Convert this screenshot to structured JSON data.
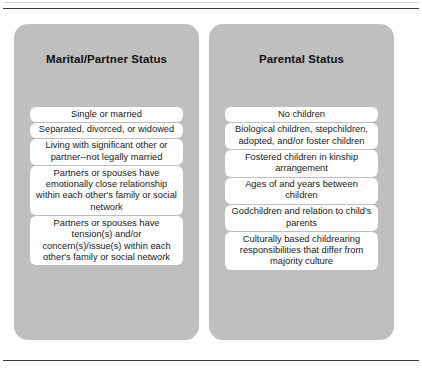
{
  "document": {
    "type": "two-column-reference-table",
    "top_rule": true,
    "bottom_rule": true,
    "panel_color": "#bfbfbf",
    "item_color": "#ffffff",
    "text_color": "#1a1a1a"
  },
  "columns": [
    {
      "title": "Marital/Partner Status",
      "items": [
        "Single or married",
        "Separated, divorced, or widowed",
        "Living with significant other or partner--not legally married",
        "Partners or spouses have emotionally close relationship within each other's family or social network",
        "Partners or spouses have tension(s) and/or concern(s)/issue(s) within each other's family or social network"
      ]
    },
    {
      "title": "Parental Status",
      "items": [
        "No children",
        "Biological children, stepchildren, adopted, and/or foster children",
        "Fostered children in kinship arrangement",
        "Ages of and years between children",
        "Godchildren and relation to child's parents",
        "Culturally based childrearing responsibilities that differ from majority culture"
      ]
    }
  ]
}
